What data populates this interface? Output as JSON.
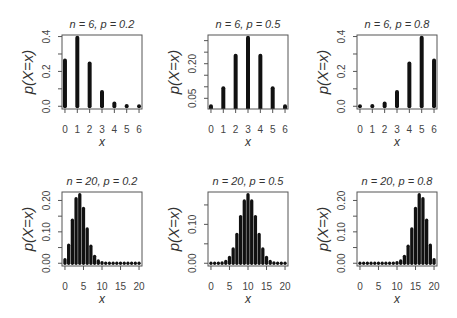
{
  "figure": {
    "rows": 2,
    "cols": 3,
    "bar_color": "#111111",
    "axis_color": "#555555",
    "text_color": "#333333"
  },
  "chart_data": [
    {
      "type": "bar",
      "title": "n = 6, p = 0.2",
      "xlabel": "x",
      "ylabel": "p(X=x)",
      "categories": [
        0,
        1,
        2,
        3,
        4,
        5,
        6
      ],
      "values": [
        0.262144,
        0.393216,
        0.24576,
        0.08192,
        0.01536,
        0.001536,
        6.4e-05
      ],
      "xlim": [
        -0.24,
        6.24
      ],
      "ylim": [
        -0.015662,
        0.408942
      ],
      "xticks": [
        0,
        1,
        2,
        3,
        4,
        5,
        6
      ],
      "xtick_labels": [
        "0",
        "1",
        "2",
        "3",
        "4",
        "5",
        "6"
      ],
      "yticks": [
        0,
        0.1,
        0.2,
        0.3,
        0.4
      ],
      "ytick_labels": [
        "0.0",
        "",
        "0.2",
        "",
        "0.4"
      ],
      "grid": false,
      "legend": null
    },
    {
      "type": "bar",
      "title": "n = 6, p = 0.5",
      "xlabel": "x",
      "ylabel": "p(X=x)",
      "categories": [
        0,
        1,
        2,
        3,
        4,
        5,
        6
      ],
      "values": [
        0.015625,
        0.09375,
        0.234375,
        0.3125,
        0.234375,
        0.09375,
        0.015625
      ],
      "xlim": [
        -0.24,
        6.24
      ],
      "ylim": [
        0.00375,
        0.324375
      ],
      "xticks": [
        0,
        1,
        2,
        3,
        4,
        5,
        6
      ],
      "xtick_labels": [
        "0",
        "1",
        "2",
        "3",
        "4",
        "5",
        "6"
      ],
      "yticks": [
        0.05,
        0.1,
        0.15,
        0.2,
        0.25,
        0.3
      ],
      "ytick_labels": [
        "0.05",
        "",
        "",
        "0.20",
        "",
        ""
      ],
      "grid": false,
      "legend": null
    },
    {
      "type": "bar",
      "title": "n = 6, p = 0.8",
      "xlabel": "x",
      "ylabel": "p(X=x)",
      "categories": [
        0,
        1,
        2,
        3,
        4,
        5,
        6
      ],
      "values": [
        6.4e-05,
        0.001536,
        0.01536,
        0.08192,
        0.24576,
        0.393216,
        0.262144
      ],
      "xlim": [
        -0.24,
        6.24
      ],
      "ylim": [
        -0.015662,
        0.408942
      ],
      "xticks": [
        0,
        1,
        2,
        3,
        4,
        5,
        6
      ],
      "xtick_labels": [
        "0",
        "1",
        "2",
        "3",
        "4",
        "5",
        "6"
      ],
      "yticks": [
        0,
        0.1,
        0.2,
        0.3,
        0.4
      ],
      "ytick_labels": [
        "0.0",
        "",
        "0.2",
        "",
        "0.4"
      ],
      "grid": false,
      "legend": null
    },
    {
      "type": "bar",
      "title": "n = 20, p = 0.2",
      "xlabel": "x",
      "ylabel": "p(X=x)",
      "categories": [
        0,
        1,
        2,
        3,
        4,
        5,
        6,
        7,
        8,
        9,
        10,
        11,
        12,
        13,
        14,
        15,
        16,
        17,
        18,
        19,
        20
      ],
      "values": [
        0.0115292,
        0.0576461,
        0.1369094,
        0.2053641,
        0.2181994,
        0.1745595,
        0.1090997,
        0.0545499,
        0.0221609,
        0.007387,
        0.0020314,
        0.0004617,
        8.66e-05,
        1.33e-05,
        1.7e-06,
        2e-07,
        0,
        0,
        0,
        0,
        0
      ],
      "xlim": [
        -0.8,
        20.8
      ],
      "ylim": [
        -0.008728,
        0.226927
      ],
      "xticks": [
        0,
        5,
        10,
        15,
        20
      ],
      "xtick_labels": [
        "0",
        "5",
        "10",
        "15",
        "20"
      ],
      "yticks": [
        0,
        0.05,
        0.1,
        0.15,
        0.2
      ],
      "ytick_labels": [
        "0.00",
        "",
        "0.10",
        "",
        "0.20"
      ],
      "grid": false,
      "legend": null
    },
    {
      "type": "bar",
      "title": "n = 20, p = 0.5",
      "xlabel": "x",
      "ylabel": "p(X=x)",
      "categories": [
        0,
        1,
        2,
        3,
        4,
        5,
        6,
        7,
        8,
        9,
        10,
        11,
        12,
        13,
        14,
        15,
        16,
        17,
        18,
        19,
        20
      ],
      "values": [
        1e-06,
        1.91e-05,
        0.0001812,
        0.0010872,
        0.0046206,
        0.0147858,
        0.0369644,
        0.0739288,
        0.1201344,
        0.1601791,
        0.1761971,
        0.1601791,
        0.1201344,
        0.0739288,
        0.0369644,
        0.0147858,
        0.0046206,
        0.0010872,
        0.0001812,
        1.91e-05,
        1e-06
      ],
      "xlim": [
        -0.8,
        20.8
      ],
      "ylim": [
        -0.007047,
        0.183245
      ],
      "xticks": [
        0,
        5,
        10,
        15,
        20
      ],
      "xtick_labels": [
        "0",
        "5",
        "10",
        "15",
        "20"
      ],
      "yticks": [
        0,
        0.05,
        0.1,
        0.15
      ],
      "ytick_labels": [
        "0.00",
        "",
        "0.10",
        ""
      ],
      "grid": false,
      "legend": null
    },
    {
      "type": "bar",
      "title": "n = 20, p = 0.8",
      "xlabel": "x",
      "ylabel": "p(X=x)",
      "categories": [
        0,
        1,
        2,
        3,
        4,
        5,
        6,
        7,
        8,
        9,
        10,
        11,
        12,
        13,
        14,
        15,
        16,
        17,
        18,
        19,
        20
      ],
      "values": [
        0,
        0,
        0,
        0,
        0,
        2e-07,
        1.7e-06,
        1.33e-05,
        8.66e-05,
        0.0004617,
        0.0020314,
        0.007387,
        0.0221609,
        0.0545499,
        0.1090997,
        0.1745595,
        0.2181994,
        0.2053641,
        0.1369094,
        0.0576461,
        0.0115292
      ],
      "xlim": [
        -0.8,
        20.8
      ],
      "ylim": [
        -0.008728,
        0.226927
      ],
      "xticks": [
        0,
        5,
        10,
        15,
        20
      ],
      "xtick_labels": [
        "0",
        "5",
        "10",
        "15",
        "20"
      ],
      "yticks": [
        0,
        0.05,
        0.1,
        0.15,
        0.2
      ],
      "ytick_labels": [
        "0.00",
        "",
        "0.10",
        "",
        "0.20"
      ],
      "grid": false,
      "legend": null
    }
  ]
}
